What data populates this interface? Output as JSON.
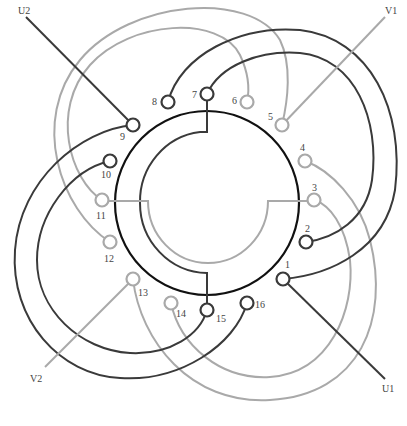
{
  "diagram": {
    "colors": {
      "phase_u": "#3a3a3a",
      "phase_v": "#a9a9a9",
      "main_ring": "#111111",
      "background": "#ffffff"
    },
    "terminals": [
      {
        "id": "1",
        "label": "1",
        "phase": "U"
      },
      {
        "id": "2",
        "label": "2",
        "phase": "U"
      },
      {
        "id": "3",
        "label": "3",
        "phase": "V"
      },
      {
        "id": "4",
        "label": "4",
        "phase": "V"
      },
      {
        "id": "5",
        "label": "5",
        "phase": "V"
      },
      {
        "id": "6",
        "label": "6",
        "phase": "V"
      },
      {
        "id": "7",
        "label": "7",
        "phase": "U"
      },
      {
        "id": "8",
        "label": "8",
        "phase": "U"
      },
      {
        "id": "9",
        "label": "9",
        "phase": "U"
      },
      {
        "id": "10",
        "label": "10",
        "phase": "U"
      },
      {
        "id": "11",
        "label": "11",
        "phase": "V"
      },
      {
        "id": "12",
        "label": "12",
        "phase": "V"
      },
      {
        "id": "13",
        "label": "13",
        "phase": "V"
      },
      {
        "id": "14",
        "label": "14",
        "phase": "V"
      },
      {
        "id": "15",
        "label": "15",
        "phase": "U"
      },
      {
        "id": "16",
        "label": "16",
        "phase": "U"
      }
    ],
    "leads": [
      {
        "label": "U1",
        "terminal": "1",
        "phase": "U"
      },
      {
        "label": "U2",
        "terminal": "9",
        "phase": "U"
      },
      {
        "label": "V1",
        "terminal": "5",
        "phase": "V"
      },
      {
        "label": "V2",
        "terminal": "13",
        "phase": "V"
      }
    ],
    "coil_connections": [
      {
        "from": "8",
        "to": "1",
        "phase": "U",
        "group": "outer"
      },
      {
        "from": "7",
        "to": "2",
        "phase": "U",
        "group": "inner"
      },
      {
        "from": "9",
        "to": "16",
        "phase": "U",
        "group": "outer"
      },
      {
        "from": "10",
        "to": "15",
        "phase": "U",
        "group": "inner"
      },
      {
        "from": "12",
        "to": "5",
        "phase": "V",
        "group": "outer"
      },
      {
        "from": "11",
        "to": "6",
        "phase": "V",
        "group": "inner"
      },
      {
        "from": "13",
        "to": "4",
        "phase": "V",
        "group": "outer"
      },
      {
        "from": "14",
        "to": "3",
        "phase": "V",
        "group": "inner"
      }
    ],
    "internal_jumpers": [
      {
        "from": "7",
        "to": "15",
        "phase": "U"
      },
      {
        "from": "11",
        "to": "3",
        "phase": "V"
      }
    ]
  }
}
